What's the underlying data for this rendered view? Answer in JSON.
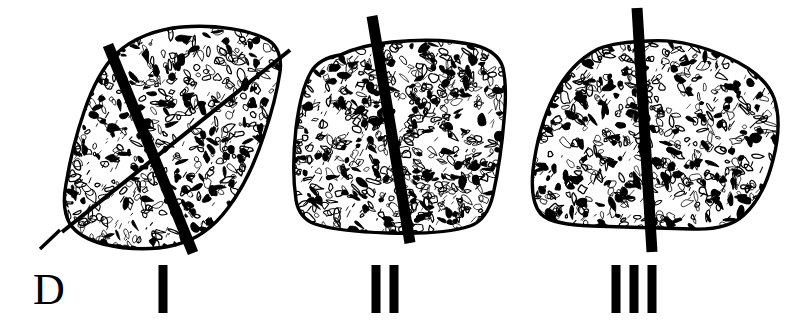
{
  "figure": {
    "kind": "anatomical-line-drawing",
    "background_color": "#ffffff",
    "ink_color": "#000000",
    "width": 811,
    "height": 322
  },
  "direction_marker": {
    "label": "D",
    "name": "dorsal-direction-marker",
    "leader_line": {
      "x1": 40,
      "y1": 249,
      "x2": 60,
      "y2": 230
    },
    "x": 33,
    "y": 268,
    "font_size": 44
  },
  "panels": [
    {
      "id": "panel-1",
      "numeral": "I",
      "numeral_x": 163,
      "numeral_y": 265,
      "bar_count": 1,
      "specimen_name": "bone-section-i",
      "rod": {
        "x1": 108,
        "y1": 45,
        "x2": 193,
        "y2": 253,
        "width": 11
      },
      "secondary_lines": [
        {
          "x1": 62,
          "y1": 232,
          "x2": 290,
          "y2": 50,
          "width": 4
        }
      ]
    },
    {
      "id": "panel-2",
      "numeral": "II",
      "numeral_x": 385,
      "numeral_y": 265,
      "bar_count": 2,
      "specimen_name": "bone-section-ii",
      "rod": {
        "x1": 372,
        "y1": 16,
        "x2": 410,
        "y2": 243,
        "width": 11
      },
      "secondary_lines": []
    },
    {
      "id": "panel-3",
      "numeral": "III",
      "numeral_x": 634,
      "numeral_y": 265,
      "bar_count": 3,
      "specimen_name": "bone-section-iii",
      "rod": {
        "x1": 637,
        "y1": 8,
        "x2": 652,
        "y2": 252,
        "width": 11
      },
      "secondary_lines": []
    }
  ],
  "outlines": {
    "bone_i": "M 182,27 C 215,24 250,30 268,40 C 278,46 282,58 280,72 C 277,92 272,112 264,135 C 256,160 243,188 228,208 C 214,227 196,240 175,245 C 150,251 124,249 103,244 C 88,240 76,233 70,224 C 64,214 63,200 66,184 C 70,160 76,135 84,112 C 92,88 102,68 116,54 C 132,38 158,29 182,27 Z",
    "bone_ii": "M 340,55 C 355,48 372,44 392,42 C 424,39 452,40 474,45 C 490,49 500,57 503,68 C 506,82 506,100 504,120 C 502,146 498,172 493,195 C 489,212 482,222 470,226 C 452,232 420,234 388,233 C 356,232 330,229 315,224 C 304,220 298,212 296,200 C 293,180 293,155 296,128 C 299,104 304,84 311,72 C 317,62 327,57 340,55 Z",
    "bone_iii": "M 648,41 C 672,39 700,45 727,57 C 752,68 768,82 774,98 C 780,115 779,137 773,160 C 767,184 757,203 744,215 C 732,226 714,230 692,229 C 660,228 622,227 592,226 C 566,225 549,222 541,214 C 533,205 531,190 533,170 C 536,144 543,118 554,96 C 565,74 580,58 598,49 C 613,43 631,42 648,41 Z"
  },
  "texture": {
    "name": "trabecular-bone-stipple",
    "description": "dense irregular mottled marks filling each bone outline",
    "seed": 20240617,
    "density_i": 560,
    "density_ii": 620,
    "density_iii": 600
  },
  "numeral_bar": {
    "width": 9,
    "height": 48,
    "gap": 9
  }
}
